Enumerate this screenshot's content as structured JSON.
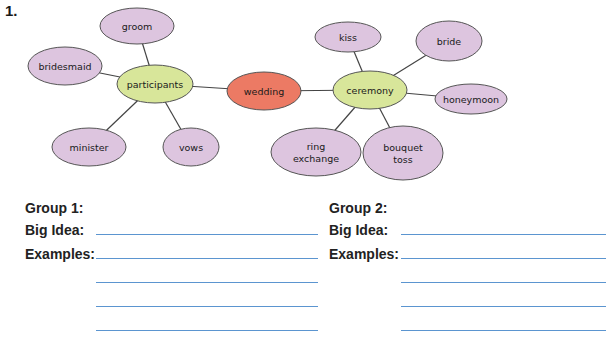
{
  "question_number": "1.",
  "web": {
    "center": {
      "label": "wedding",
      "cx": 264,
      "cy": 91,
      "rx": 37,
      "ry": 19,
      "fill": "#ec7a64"
    },
    "hubs": [
      {
        "label": "participants",
        "cx": 155,
        "cy": 84,
        "rx": 38,
        "ry": 19,
        "fill": "#d8e69a"
      },
      {
        "label": "ceremony",
        "cx": 370,
        "cy": 90,
        "rx": 37,
        "ry": 19,
        "fill": "#d8e69a"
      }
    ],
    "leaves": [
      {
        "label": "groom",
        "hub": 0,
        "cx": 137,
        "cy": 26,
        "rx": 37,
        "ry": 18
      },
      {
        "label": "bridesmaid",
        "hub": 0,
        "cx": 65,
        "cy": 66,
        "rx": 37,
        "ry": 19
      },
      {
        "label": "minister",
        "hub": 0,
        "cx": 89,
        "cy": 147,
        "rx": 37,
        "ry": 19
      },
      {
        "label": "vows",
        "hub": 0,
        "cx": 191,
        "cy": 147,
        "rx": 28,
        "ry": 19
      },
      {
        "label": "kiss",
        "hub": 1,
        "cx": 348,
        "cy": 37,
        "rx": 33,
        "ry": 15
      },
      {
        "label": "bride",
        "hub": 1,
        "cx": 449,
        "cy": 41,
        "rx": 33,
        "ry": 20
      },
      {
        "label": "honeymoon",
        "hub": 1,
        "cx": 471,
        "cy": 99,
        "rx": 36,
        "ry": 15
      },
      {
        "label": "ring\nexchange",
        "hub": 1,
        "cx": 316,
        "cy": 152,
        "rx": 45,
        "ry": 24
      },
      {
        "label": "bouquet\ntoss",
        "hub": 1,
        "cx": 403,
        "cy": 153,
        "rx": 40,
        "ry": 27
      }
    ],
    "leaf_fill": "#ddc5df",
    "stroke": "#444444"
  },
  "groups": [
    {
      "title": "Group 1:",
      "big_idea_label": "Big Idea:",
      "examples_label": "Examples:",
      "big_idea_value": "",
      "examples_values": [
        "",
        "",
        "",
        ""
      ]
    },
    {
      "title": "Group 2:",
      "big_idea_label": "Big Idea:",
      "examples_label": "Examples:",
      "big_idea_value": "",
      "examples_values": [
        "",
        "",
        "",
        ""
      ]
    }
  ],
  "line_color": "#5b95d0"
}
